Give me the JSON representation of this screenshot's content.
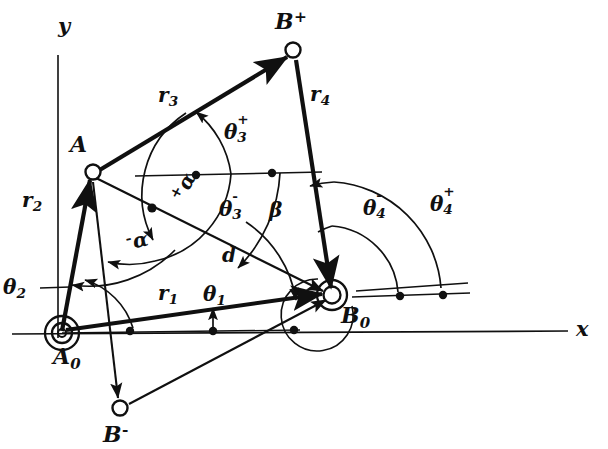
{
  "figure": {
    "background": "#ffffff",
    "ink": "#101010",
    "width": 608,
    "height": 449
  },
  "axes": {
    "x_label": "x",
    "y_label": "y"
  },
  "joints": [
    {
      "id": "A0",
      "label": "A",
      "sub": "0",
      "sup": "",
      "type": "ground-pivot",
      "x": 62,
      "y": 333
    },
    {
      "id": "B0",
      "label": "B",
      "sub": "0",
      "sup": "",
      "type": "ground-pivot",
      "x": 330,
      "y": 295
    },
    {
      "id": "A",
      "label": "A",
      "sub": "",
      "sup": "",
      "type": "moving-pivot",
      "x": 92,
      "y": 172
    },
    {
      "id": "Bp",
      "label": "B",
      "sub": "",
      "sup": "+",
      "type": "moving-pivot",
      "x": 293,
      "y": 52
    },
    {
      "id": "Bm",
      "label": "B",
      "sub": "",
      "sup": "-",
      "type": "moving-pivot",
      "x": 120,
      "y": 407
    }
  ],
  "vectors": [
    {
      "name": "r1",
      "label": "r",
      "sub": "1",
      "from": "A0",
      "to": "B0",
      "desc": "ground link"
    },
    {
      "name": "r2",
      "label": "r",
      "sub": "2",
      "from": "A0",
      "to": "A",
      "desc": "input crank"
    },
    {
      "name": "r3",
      "label": "r",
      "sub": "3",
      "from": "A",
      "to": "Bp",
      "desc": "coupler"
    },
    {
      "name": "r4",
      "label": "r",
      "sub": "4",
      "from": "Bp",
      "to": "B0",
      "desc": "output link"
    },
    {
      "name": "d",
      "label": "d",
      "sub": "",
      "from": "A",
      "to": "B0",
      "desc": "diagonal"
    }
  ],
  "angles": [
    {
      "name": "theta1",
      "label": "θ",
      "sub": "1",
      "sup": "",
      "x": 203,
      "y": 284,
      "desc": "ground link angle"
    },
    {
      "name": "theta2",
      "label": "θ",
      "sub": "2",
      "sup": "",
      "x": 3,
      "y": 277,
      "desc": "input crank angle"
    },
    {
      "name": "theta3plus",
      "label": "θ",
      "sub": "3",
      "sup": "+",
      "x": 224,
      "y": 122,
      "desc": "coupler angle, open circuit"
    },
    {
      "name": "theta3minus",
      "label": "θ",
      "sub": "3",
      "sup": "-",
      "x": 219,
      "y": 199,
      "desc": "coupler angle, crossed circuit"
    },
    {
      "name": "theta4minus",
      "label": "θ",
      "sub": "4",
      "sup": "-",
      "x": 363,
      "y": 198,
      "desc": "output angle, crossed circuit"
    },
    {
      "name": "theta4plus",
      "label": "θ",
      "sub": "4",
      "sup": "+",
      "x": 430,
      "y": 194,
      "desc": "output angle, open circuit"
    },
    {
      "name": "beta",
      "label": "β",
      "sub": "",
      "sup": "",
      "x": 269,
      "y": 200,
      "desc": "transmission angle at A"
    },
    {
      "name": "alphaplus",
      "label": "α",
      "sub": "",
      "sup": "+",
      "x": 167,
      "y": 194,
      "desc": "alpha plus, diagonal to coupler"
    },
    {
      "name": "alphaminus",
      "label": "α",
      "sub": "",
      "sup": "-",
      "x": 124,
      "y": 232,
      "desc": "alpha minus, diagonal to coupler"
    }
  ]
}
